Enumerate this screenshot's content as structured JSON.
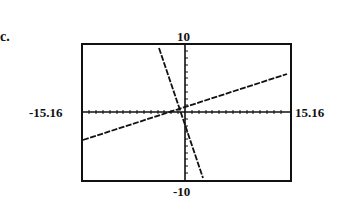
{
  "part_label": "c.",
  "window": {
    "xmin": "-15.16",
    "xmax": "15.16",
    "ymin": "-10",
    "ymax": "10"
  },
  "graph": {
    "description": "Graphing calculator window showing two lines intersecting near the origin",
    "lines": [
      {
        "name": "steep-line",
        "slope_sign": "negative",
        "from": [
          -4.2,
          10
        ],
        "to": [
          2.8,
          -10
        ]
      },
      {
        "name": "shallow-line",
        "slope_sign": "positive",
        "from": [
          -15.16,
          -4.1
        ],
        "to": [
          15.16,
          5.7
        ]
      }
    ],
    "axis_color": "#111111",
    "frame_color": "#111111"
  }
}
